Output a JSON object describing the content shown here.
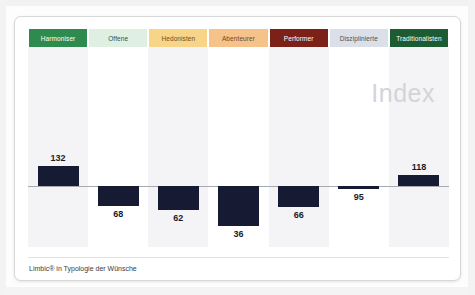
{
  "card": {
    "watermark": "Index",
    "footer_caption": "Limbic® in Typologie der Wünsche"
  },
  "chart_data": {
    "type": "bar",
    "title": "",
    "subtitle": "",
    "xlabel": "",
    "ylabel": "Index",
    "baseline": 100,
    "grid": false,
    "legend_position": "top",
    "axis_visible": [
      "zero-line"
    ],
    "ylim": [
      30,
      140
    ],
    "categories": [
      "Harmoniser",
      "Offene",
      "Hedonisten",
      "Abenteurer",
      "Performer",
      "Disziplinierte",
      "Traditionalisten"
    ],
    "values": [
      132,
      68,
      62,
      36,
      66,
      95,
      118
    ],
    "value_labels": [
      "132",
      "68",
      "62",
      "36",
      "66",
      "95",
      "118"
    ],
    "bar_color": "#161b33",
    "category_colors": [
      "#2e8b4f",
      "#dff0e2",
      "#f7d487",
      "#f5c28a",
      "#7c2118",
      "#dadfe8",
      "#1d5c33"
    ],
    "category_text_colors": [
      "#ffffff",
      "#3c4a43",
      "#6b5224",
      "#6b4a2a",
      "#ffffff",
      "#4a4f5c",
      "#ffffff"
    ],
    "band_colors": [
      "#f4f4f6",
      "#ffffff",
      "#f4f4f6",
      "#ffffff",
      "#f4f4f6",
      "#ffffff",
      "#f4f4f6"
    ]
  }
}
